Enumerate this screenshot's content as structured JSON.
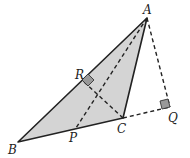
{
  "diagram": {
    "type": "triangle-geometry",
    "fill_color": "#d4d4d4",
    "stroke_color": "#222222",
    "points": {
      "A": {
        "label": "A",
        "x": 147,
        "y": 18,
        "lx": 143,
        "ly": 14
      },
      "B": {
        "label": "B",
        "x": 18,
        "y": 142,
        "lx": 8,
        "ly": 154
      },
      "C": {
        "label": "C",
        "x": 123,
        "y": 118,
        "lx": 117,
        "ly": 133
      },
      "P": {
        "label": "P",
        "x": 76,
        "y": 128,
        "lx": 69,
        "ly": 142
      },
      "Q": {
        "label": "Q",
        "x": 170,
        "y": 107,
        "lx": 168,
        "ly": 122
      },
      "R": {
        "label": "R",
        "x": 82,
        "y": 80,
        "lx": 75,
        "ly": 79
      }
    },
    "solid_segments": [
      "AB",
      "BC",
      "CA"
    ],
    "dashed_segments": [
      "AP",
      "CR",
      "AQ",
      "CQ"
    ],
    "right_angles": [
      "R",
      "Q"
    ]
  }
}
